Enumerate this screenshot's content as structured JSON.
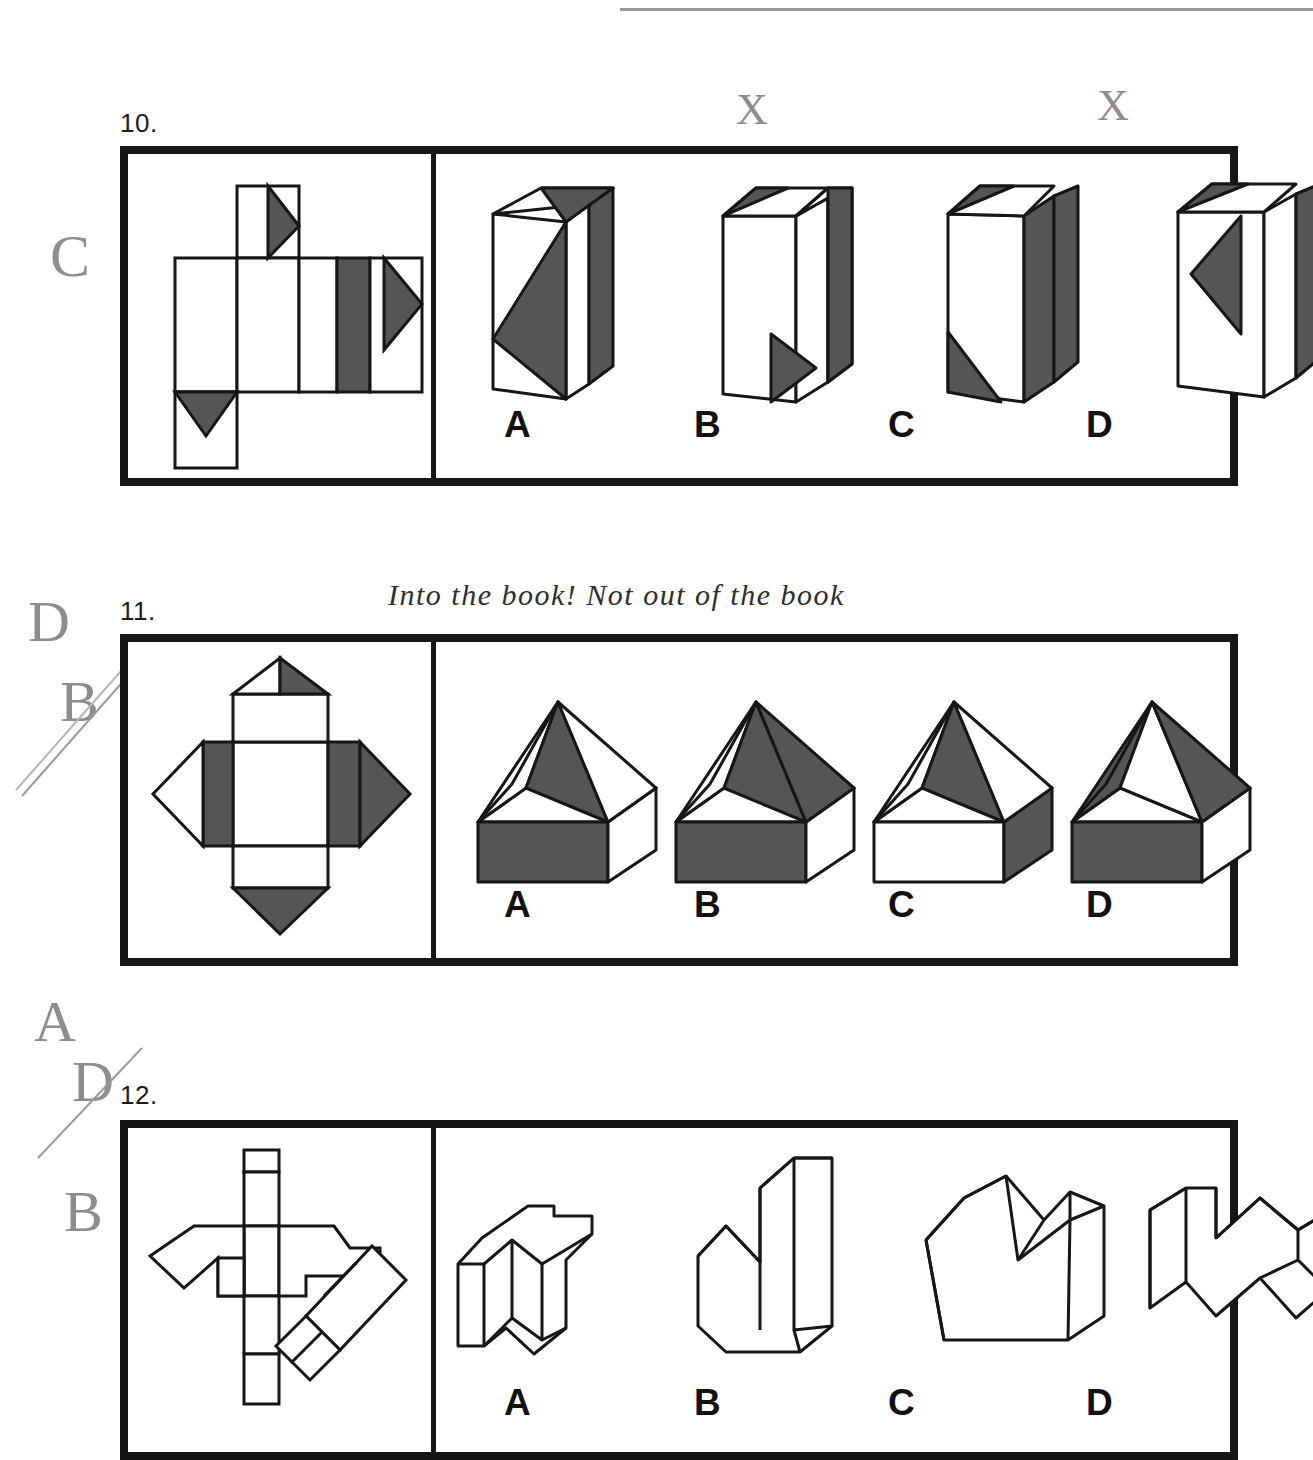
{
  "page": {
    "width": 1313,
    "height": 1449,
    "background": "#ffffff",
    "ink_grey": "#555555",
    "ink_black": "#161616",
    "pencil_grey": "#8d8d8d"
  },
  "handwriting": {
    "note_above_q11": "Into the book! Not out of the book",
    "margin_q10": "C",
    "margin_q11_first": "D",
    "margin_q11_second": "B",
    "margin_q12_first": "A",
    "margin_q12_second": "D",
    "margin_q12_third": "B",
    "x_mark_1": "X",
    "x_mark_2": "X"
  },
  "questions": [
    {
      "number": "10.",
      "type": "folding-net-to-solid",
      "net_description": "cross-shaped net of a rectangular box with three shaded right triangles",
      "options": [
        {
          "label": "A",
          "solid": "tall-rectangular-box"
        },
        {
          "label": "B",
          "solid": "tall-rectangular-box"
        },
        {
          "label": "C",
          "solid": "tall-rectangular-box"
        },
        {
          "label": "D",
          "solid": "tall-rectangular-box"
        }
      ]
    },
    {
      "number": "11.",
      "type": "folding-net-to-solid",
      "net_description": "square net with four flaps, shaded triangles and rectangles",
      "options": [
        {
          "label": "A",
          "solid": "open-box-with-pyramid-roof"
        },
        {
          "label": "B",
          "solid": "open-box-with-pyramid-roof"
        },
        {
          "label": "C",
          "solid": "open-box-with-pyramid-roof"
        },
        {
          "label": "D",
          "solid": "open-box-with-pyramid-roof"
        }
      ]
    },
    {
      "number": "12.",
      "type": "folding-net-to-solid",
      "net_description": "irregular outline net with vertical strip of squares and a diagonal strip",
      "options": [
        {
          "label": "A",
          "solid": "zigzag-folded-form"
        },
        {
          "label": "B",
          "solid": "zigzag-folded-form"
        },
        {
          "label": "C",
          "solid": "zigzag-folded-form"
        },
        {
          "label": "D",
          "solid": "zigzag-folded-form"
        }
      ]
    }
  ]
}
